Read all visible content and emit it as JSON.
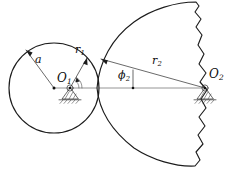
{
  "figure": {
    "kind": "kinematic-contact-diagram",
    "background_color": "#ffffff",
    "line_color": "#1c1c1c",
    "width": 233,
    "height": 174
  },
  "labels": {
    "radius_a": "a",
    "radius_r1_base": "r",
    "radius_r1_sub": "1",
    "pivot_O1_base": "O",
    "pivot_O1_sub": "1",
    "angle_phi2_sym": "ϕ",
    "angle_phi2_sub": "2",
    "radius_r2_base": "r",
    "radius_r2_sub": "2",
    "pivot_O2_base": "O",
    "pivot_O2_sub": "2"
  },
  "geometry": {
    "small_circle": {
      "cx": 54,
      "cy": 88,
      "r": 45
    },
    "pivot_O1": {
      "x": 70,
      "y": 88
    },
    "pivot_O2": {
      "x": 205,
      "y": 88
    },
    "cusp_point": {
      "x": 97,
      "y": 88
    },
    "centerline_y": 88,
    "phi2_tick": {
      "x": 133,
      "y": 88
    }
  }
}
